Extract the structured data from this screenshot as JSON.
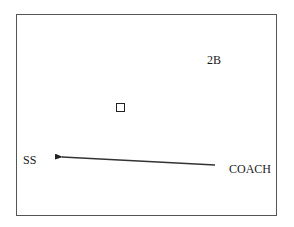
{
  "diagram": {
    "labels": {
      "second_base": "2B",
      "shortstop": "SS",
      "coach": "COACH"
    },
    "marker": {
      "shape": "square",
      "description": "base marker"
    },
    "arrow": {
      "from": "COACH",
      "to": "SS",
      "color": "#222222"
    },
    "colors": {
      "frame": "#555555",
      "text": "#1a1a1a",
      "background": "#ffffff"
    }
  }
}
